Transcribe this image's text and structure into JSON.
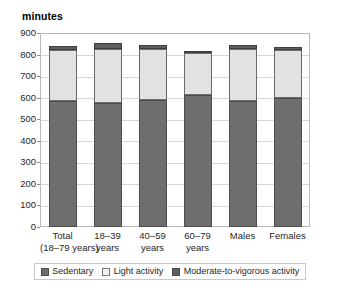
{
  "chart_data": {
    "type": "bar",
    "subtype": "stacked-vertical",
    "title": "",
    "xlabel": "",
    "ylabel": "minutes",
    "ylim": [
      0,
      900
    ],
    "yticks": [
      0,
      100,
      200,
      300,
      400,
      500,
      600,
      700,
      800,
      900
    ],
    "ytick_labels": [
      "0",
      "100",
      "200",
      "300",
      "400",
      "500",
      "600",
      "700",
      "800",
      "900"
    ],
    "grid": true,
    "legend_position": "bottom",
    "categories": [
      "Total\n(18–79 years)",
      "18–39\nyears",
      "40–59\nyears",
      "60–79\nyears",
      "Males",
      "Females"
    ],
    "category_lines": [
      [
        "Total",
        "(18–79 years)"
      ],
      [
        "18–39",
        "years"
      ],
      [
        "40–59",
        "years"
      ],
      [
        "60–79",
        "years"
      ],
      [
        "Males",
        ""
      ],
      [
        "Females",
        ""
      ]
    ],
    "series": [
      {
        "name": "Sedentary",
        "color": "#6e6e6e",
        "values": [
          583,
          577,
          590,
          611,
          584,
          600
        ]
      },
      {
        "name": "Light activity",
        "color": "#e2e2e2",
        "values": [
          240,
          250,
          235,
          195,
          240,
          220
        ]
      },
      {
        "name": "Moderate-to-vigorous activity",
        "color": "#5e5e5e",
        "values": [
          18,
          25,
          18,
          12,
          22,
          15
        ]
      }
    ],
    "totals": [
      841,
      852,
      843,
      818,
      846,
      835
    ],
    "legend": [
      "Sedentary",
      "Light activity",
      "Moderate-to-vigorous activity"
    ],
    "colors": {
      "sedentary": "#6e6e6e",
      "light_activity": "#e2e2e2",
      "mvpa": "#5e5e5e",
      "gridline": "#d6d6d6",
      "axis": "#b9b9b9",
      "text": "#1f1f1f"
    }
  }
}
